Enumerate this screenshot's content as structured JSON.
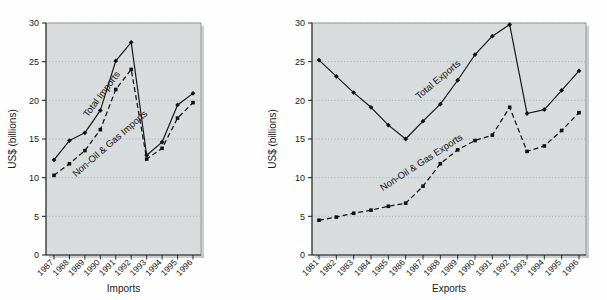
{
  "figure": {
    "background_color": "#fefefe",
    "plot_background_color": "#d8dcdd",
    "gridline_color": "#9aa0a2",
    "line_color": "#111111",
    "marker_color": "#111111"
  },
  "charts": [
    {
      "id": "imports",
      "axis_title_y": "US$ (billions)",
      "axis_title_x": "Imports",
      "annotations": [
        {
          "name": "total-imports-label",
          "text": "Total Imports"
        },
        {
          "name": "non-oil-gas-imports-label",
          "text": "Non-Oil & Gas Imports"
        }
      ],
      "chart_data": {
        "type": "line",
        "title": "",
        "xlabel": "Imports",
        "ylabel": "US$ (billions)",
        "ylim": [
          0,
          30
        ],
        "yticks": [
          0,
          5,
          10,
          15,
          20,
          25,
          30
        ],
        "ytick_labels": [
          "0",
          "5",
          "10",
          "15",
          "20",
          "25",
          "30"
        ],
        "grid": true,
        "legend_position": "inline-annotation",
        "categories": [
          "1987",
          "1988",
          "1989",
          "1990",
          "1991",
          "1992",
          "1993",
          "1994",
          "1995",
          "1996"
        ],
        "series": [
          {
            "name": "Total Imports",
            "linestyle": "solid",
            "marker": "diamond",
            "values": [
              12.3,
              14.8,
              15.8,
              18.7,
              25.1,
              27.5,
              12.9,
              14.6,
              19.4,
              20.9
            ]
          },
          {
            "name": "Non-Oil & Gas Imports",
            "linestyle": "dashed",
            "marker": "square",
            "values": [
              10.3,
              11.8,
              13.5,
              16.2,
              21.4,
              24.0,
              12.4,
              13.8,
              17.7,
              19.7
            ]
          }
        ]
      }
    },
    {
      "id": "exports",
      "axis_title_y": "US$ (billions)",
      "axis_title_x": "Exports",
      "annotations": [
        {
          "name": "total-exports-label",
          "text": "Total Exports"
        },
        {
          "name": "non-oil-gas-exports-label",
          "text": "Non-Oil & Gas Exports"
        }
      ],
      "chart_data": {
        "type": "line",
        "title": "",
        "xlabel": "Exports",
        "ylabel": "US$ (billions)",
        "ylim": [
          0,
          30
        ],
        "yticks": [
          0,
          5,
          10,
          15,
          20,
          25,
          30
        ],
        "ytick_labels": [
          "0",
          "5",
          "10",
          "15",
          "20",
          "25",
          "30"
        ],
        "grid": true,
        "legend_position": "inline-annotation",
        "categories": [
          "1981",
          "1982",
          "1983",
          "1984",
          "1985",
          "1986",
          "1987",
          "1988",
          "1989",
          "1990",
          "1991",
          "1992",
          "1993",
          "1994",
          "1995",
          "1996"
        ],
        "series": [
          {
            "name": "Total Exports",
            "linestyle": "solid",
            "marker": "diamond",
            "values": [
              25.2,
              23.1,
              21.0,
              19.1,
              16.8,
              15.0,
              17.3,
              19.5,
              22.6,
              25.9,
              28.3,
              29.8,
              18.3,
              18.8,
              21.3,
              23.8
            ]
          },
          {
            "name": "Non-Oil & Gas Exports",
            "linestyle": "dashed",
            "marker": "square",
            "values": [
              4.5,
              4.9,
              5.4,
              5.8,
              6.3,
              6.7,
              8.9,
              11.8,
              13.6,
              14.8,
              15.5,
              19.1,
              13.4,
              14.1,
              16.1,
              18.4
            ]
          }
        ]
      }
    }
  ]
}
